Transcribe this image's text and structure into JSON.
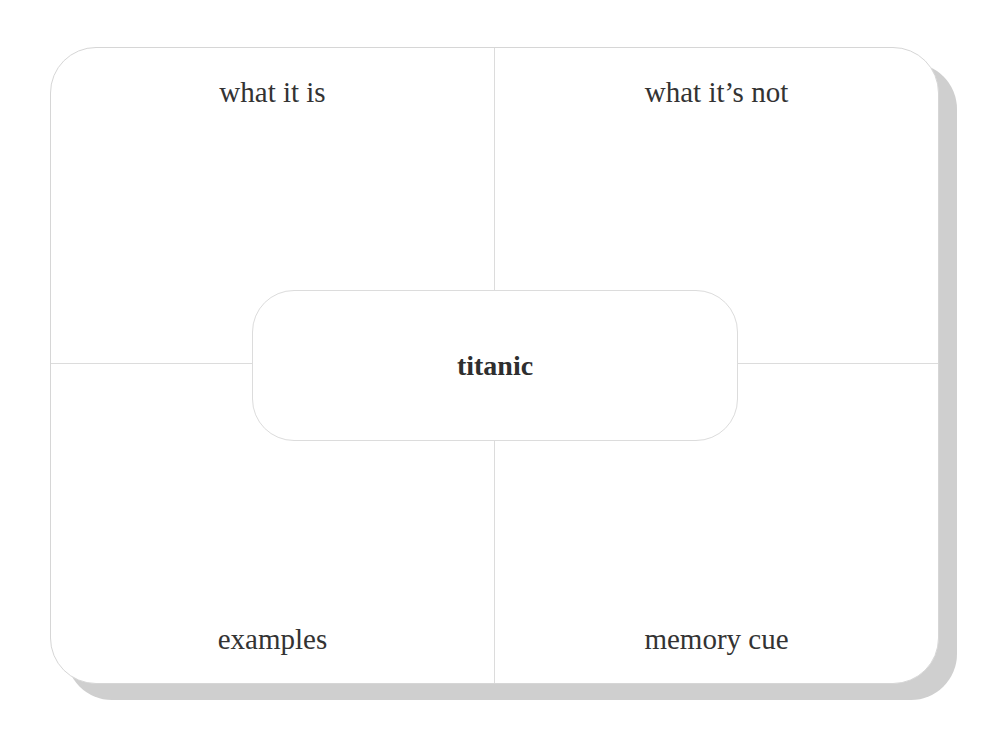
{
  "diagram": {
    "type": "frayer-model",
    "center_term": "titanic",
    "quadrants": {
      "top_left": "what it is",
      "top_right": "what it’s not",
      "bottom_left": "examples",
      "bottom_right": "memory cue"
    },
    "colors": {
      "border": "#d6d6d6",
      "divider": "#dcdcdc",
      "shadow": "#cfcfcf",
      "text": "#333333"
    }
  }
}
